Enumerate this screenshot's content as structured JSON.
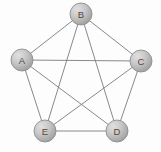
{
  "figure": {
    "background_color": "#fdfdfd",
    "width": 161,
    "height": 152
  },
  "chart_data": {
    "type": "diagram",
    "diagram_type": "graph",
    "node_count": 5,
    "edge_count": 10,
    "node_radius": 11,
    "node_fill_light": "#d6d6d6",
    "node_fill_dark": "#9c9c9c",
    "node_stroke": "#8e8e8e",
    "edge_color": "#7c7c7c",
    "edge_width": 0.9,
    "label_color": "#4a4a4a",
    "nodes": [
      {
        "id": "B",
        "label": "B",
        "x": 81,
        "y": 14
      },
      {
        "id": "A",
        "label": "A",
        "x": 22,
        "y": 60
      },
      {
        "id": "C",
        "label": "C",
        "x": 141,
        "y": 61
      },
      {
        "id": "E",
        "label": "E",
        "x": 45,
        "y": 131
      },
      {
        "id": "D",
        "label": "D",
        "x": 117,
        "y": 131
      }
    ],
    "edges": [
      {
        "from": "A",
        "to": "B"
      },
      {
        "from": "A",
        "to": "C"
      },
      {
        "from": "A",
        "to": "D"
      },
      {
        "from": "A",
        "to": "E"
      },
      {
        "from": "B",
        "to": "C"
      },
      {
        "from": "B",
        "to": "D"
      },
      {
        "from": "B",
        "to": "E"
      },
      {
        "from": "C",
        "to": "D"
      },
      {
        "from": "C",
        "to": "E"
      },
      {
        "from": "D",
        "to": "E"
      }
    ]
  }
}
